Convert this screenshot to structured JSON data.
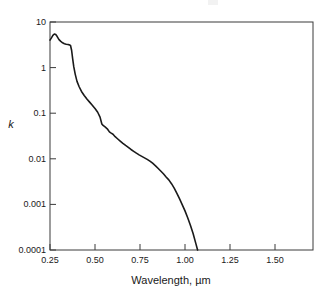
{
  "figure": {
    "background_color": "#ffffff",
    "axis_color": "#2a2a2a",
    "curve_color": "#1a1a1a"
  },
  "axis_titles": {
    "x": "Wavelength, µm",
    "y": "k"
  },
  "chart_data": {
    "type": "line",
    "title": "",
    "subtitle": "",
    "xlabel": "Wavelength, µm",
    "ylabel": "k",
    "yscale": "log",
    "xscale": "linear",
    "grid": false,
    "legend": "none",
    "xlim": [
      0.25,
      1.7111
    ],
    "ylim": [
      0.0001,
      10
    ],
    "xticks": [
      0.25,
      0.5,
      0.75,
      1.0,
      1.25,
      1.5
    ],
    "xtick_labels": [
      "0.25",
      "0.50",
      "0.75",
      "1.00",
      "1.25",
      "1.50"
    ],
    "yticks": [
      10,
      1,
      0.1,
      0.01,
      0.001,
      0.0001
    ],
    "ytick_labels": [
      "10",
      "1",
      "0.1",
      "0.01",
      "0.001",
      "0.0001"
    ],
    "series": [
      {
        "name": "k",
        "x": [
          0.25,
          0.258,
          0.266,
          0.274,
          0.282,
          0.29,
          0.3,
          0.31,
          0.32,
          0.33,
          0.34,
          0.35,
          0.358,
          0.364,
          0.37,
          0.376,
          0.382,
          0.39,
          0.4,
          0.412,
          0.425,
          0.44,
          0.455,
          0.47,
          0.485,
          0.5,
          0.515,
          0.528,
          0.538,
          0.545,
          0.556,
          0.568,
          0.58,
          0.59,
          0.6,
          0.612,
          0.625,
          0.64,
          0.655,
          0.67,
          0.685,
          0.7,
          0.715,
          0.73,
          0.745,
          0.76,
          0.775,
          0.79,
          0.805,
          0.82,
          0.835,
          0.85,
          0.865,
          0.88,
          0.895,
          0.91,
          0.925,
          0.94,
          0.955,
          0.97,
          0.985,
          1.0,
          1.015,
          1.03,
          1.045,
          1.06,
          1.07
        ],
        "y": [
          4.0,
          4.5,
          5.1,
          5.45,
          5.3,
          4.8,
          4.1,
          3.75,
          3.5,
          3.35,
          3.25,
          3.2,
          3.15,
          3.05,
          2.4,
          1.55,
          1.05,
          0.72,
          0.5,
          0.38,
          0.3,
          0.245,
          0.205,
          0.175,
          0.15,
          0.127,
          0.105,
          0.082,
          0.058,
          0.054,
          0.05,
          0.0455,
          0.039,
          0.0365,
          0.0345,
          0.0305,
          0.0275,
          0.0245,
          0.0218,
          0.0196,
          0.0178,
          0.016,
          0.0146,
          0.0133,
          0.0122,
          0.0113,
          0.0105,
          0.0097,
          0.0089,
          0.008,
          0.0071,
          0.0062,
          0.0054,
          0.0047,
          0.004,
          0.00345,
          0.00285,
          0.00228,
          0.00175,
          0.00132,
          0.00098,
          0.00072,
          0.00051,
          0.00035,
          0.00023,
          0.00014,
          0.0001
        ],
        "notes": "Extinction coefficient k versus wavelength; UV peak near 0.275 µm at k ≈ 5.4, shoulder near 0.35 µm, steep absorption edge descending to k = 0.0001 at ≈ 1.07 µm"
      }
    ]
  }
}
